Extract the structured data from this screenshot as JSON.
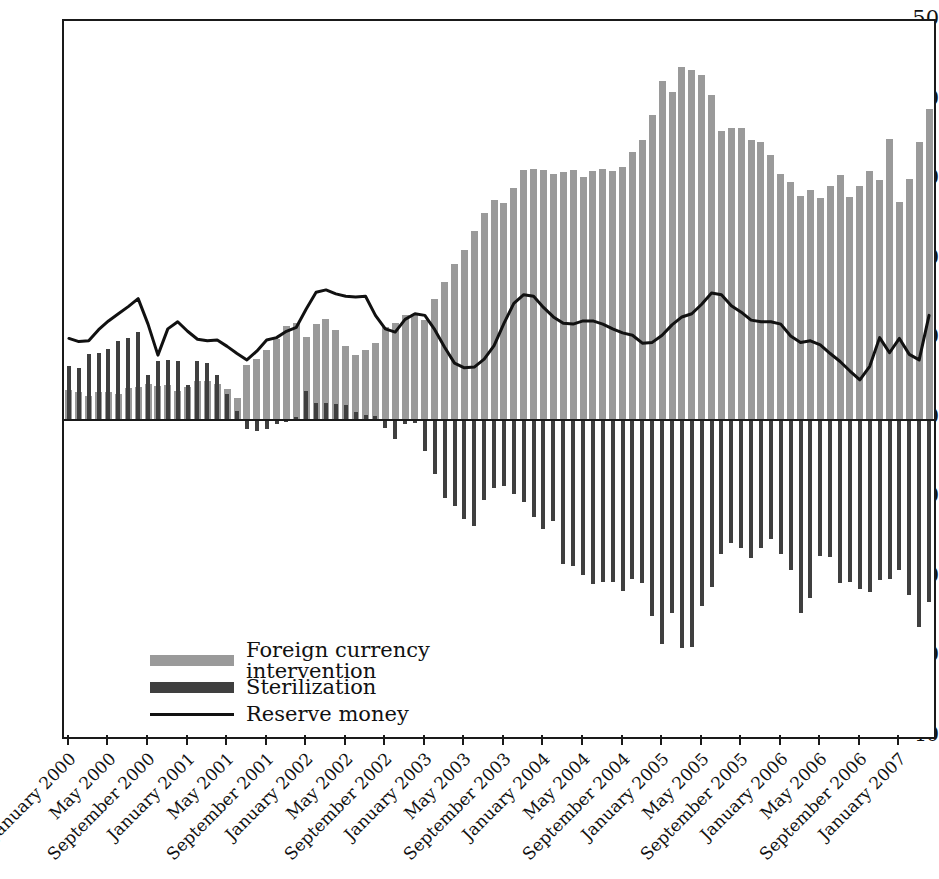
{
  "chart_data": {
    "type": "bar",
    "title": "",
    "subtitle": "",
    "xlabel": "",
    "ylabel": "",
    "ylim": [
      -40,
      50
    ],
    "yticks": [
      50,
      40,
      30,
      20,
      10,
      0,
      -10,
      -20,
      -30,
      -40
    ],
    "ytick_labels": [
      "50",
      "40",
      "30",
      "20",
      "10",
      "0",
      "−10",
      "−20",
      "−30",
      "−40"
    ],
    "grid": false,
    "legend_position": "lower-left",
    "legend": [
      {
        "label": "Foreign currency intervention",
        "marker": "bar",
        "color": "#9a9a9a"
      },
      {
        "label": "Sterilization",
        "marker": "bar",
        "color": "#3f3f3f"
      },
      {
        "label": "Reserve money",
        "marker": "line",
        "color": "#111111"
      }
    ],
    "x": [
      "January 2000",
      "February 2000",
      "March 2000",
      "April 2000",
      "May 2000",
      "June 2000",
      "July 2000",
      "August 2000",
      "September 2000",
      "October 2000",
      "November 2000",
      "December 2000",
      "January 2001",
      "February 2001",
      "March 2001",
      "April 2001",
      "May 2001",
      "June 2001",
      "July 2001",
      "August 2001",
      "September 2001",
      "October 2001",
      "November 2001",
      "December 2001",
      "January 2002",
      "February 2002",
      "March 2002",
      "April 2002",
      "May 2002",
      "June 2002",
      "July 2002",
      "August 2002",
      "September 2002",
      "October 2002",
      "November 2002",
      "December 2002",
      "January 2003",
      "February 2003",
      "March 2003",
      "April 2003",
      "May 2003",
      "June 2003",
      "July 2003",
      "August 2003",
      "September 2003",
      "October 2003",
      "November 2003",
      "December 2003",
      "January 2004",
      "February 2004",
      "March 2004",
      "April 2004",
      "May 2004",
      "June 2004",
      "July 2004",
      "August 2004",
      "September 2004",
      "October 2004",
      "November 2004",
      "December 2004",
      "January 2005",
      "February 2005",
      "March 2005",
      "April 2005",
      "May 2005",
      "June 2005",
      "July 2005",
      "August 2005",
      "September 2005",
      "October 2005",
      "November 2005",
      "December 2005",
      "January 2006",
      "February 2006",
      "March 2006",
      "April 2006",
      "May 2006",
      "June 2006",
      "July 2006",
      "August 2006",
      "September 2006",
      "October 2006",
      "November 2006",
      "December 2006",
      "January 2007",
      "February 2007",
      "March 2007",
      "April 2007"
    ],
    "xtick_labels": [
      "January 2000",
      "May 2000",
      "September 2000",
      "January 2001",
      "May 2001",
      "September 2001",
      "January 2002",
      "May 2002",
      "September 2002",
      "January 2003",
      "May 2003",
      "September 2003",
      "January 2004",
      "May 2004",
      "September 2004",
      "January 2005",
      "May 2005",
      "September 2005",
      "January 2006",
      "May 2006",
      "September 2006",
      "January 2007"
    ],
    "xtick_indices": [
      0,
      4,
      8,
      12,
      16,
      20,
      24,
      28,
      32,
      36,
      40,
      44,
      48,
      52,
      56,
      60,
      64,
      68,
      72,
      76,
      80,
      84
    ],
    "series": [
      {
        "name": "Foreign currency intervention",
        "type": "bar",
        "color": "#9a9a9a",
        "values": [
          3.6,
          3.4,
          2.9,
          3.4,
          3.4,
          3.1,
          3.9,
          4.0,
          4.4,
          4.1,
          4.2,
          3.5,
          4.0,
          4.7,
          4.8,
          4.4,
          3.8,
          2.6,
          6.8,
          7.5,
          8.6,
          10.0,
          11.6,
          12.1,
          10.3,
          11.9,
          12.6,
          11.2,
          9.2,
          8.0,
          8.7,
          9.5,
          11.5,
          12.0,
          13.0,
          13.2,
          12.4,
          15.1,
          17.2,
          19.4,
          21.2,
          23.6,
          25.9,
          27.5,
          27.1,
          29.0,
          31.3,
          31.4,
          31.3,
          30.8,
          31.0,
          31.3,
          30.4,
          31.2,
          31.4,
          31.2,
          31.7,
          33.5,
          35.0,
          38.2,
          42.4,
          41.1,
          44.2,
          43.9,
          43.2,
          40.7,
          36.2,
          36.6,
          36.6,
          35.0,
          34.8,
          33.1,
          30.8,
          29.8,
          28.0,
          28.7,
          27.7,
          29.2,
          30.7,
          27.9,
          29.2,
          31.2,
          30.0,
          35.2,
          27.2,
          30.2,
          34.8,
          39.0
        ]
      },
      {
        "name": "Sterilization",
        "type": "bar",
        "color": "#3f3f3f",
        "values": [
          6.6,
          6.4,
          8.1,
          8.3,
          8.8,
          9.8,
          10.1,
          10.9,
          5.5,
          7.2,
          7.4,
          7.3,
          4.2,
          7.3,
          7.0,
          5.5,
          3.1,
          1.0,
          -1.3,
          -1.5,
          -1.3,
          -0.6,
          -0.4,
          0.2,
          3.5,
          2.0,
          2.0,
          1.9,
          1.7,
          0.9,
          0.5,
          0.3,
          -1.1,
          -2.6,
          -0.6,
          -0.5,
          -4.0,
          -6.9,
          -9.9,
          -11.0,
          -12.6,
          -13.5,
          -10.2,
          -8.7,
          -8.4,
          -9.4,
          -10.5,
          -12.4,
          -13.9,
          -12.9,
          -18.2,
          -18.5,
          -19.7,
          -20.8,
          -20.5,
          -20.5,
          -21.6,
          -20.2,
          -20.7,
          -24.8,
          -28.3,
          -24.4,
          -28.8,
          -28.7,
          -23.5,
          -21.2,
          -17.0,
          -15.6,
          -16.2,
          -17.5,
          -16.3,
          -15.1,
          -17.0,
          -19.0,
          -24.4,
          -22.5,
          -17.2,
          -17.4,
          -20.6,
          -20.5,
          -21.4,
          -21.8,
          -20.3,
          -20.2,
          -19.0,
          -22.2,
          -26.2,
          -23.0
        ]
      },
      {
        "name": "Reserve money",
        "type": "line",
        "color": "#111111",
        "values": [
          10.1,
          9.7,
          9.8,
          11.2,
          12.3,
          13.2,
          14.1,
          15.1,
          11.9,
          8.0,
          11.3,
          12.2,
          11.0,
          10.0,
          9.8,
          9.9,
          9.1,
          8.2,
          7.4,
          8.5,
          9.9,
          10.2,
          11.0,
          11.5,
          13.8,
          15.9,
          16.2,
          15.7,
          15.4,
          15.3,
          15.4,
          13.0,
          11.3,
          10.9,
          12.5,
          13.2,
          13.0,
          11.2,
          9.0,
          7.0,
          6.4,
          6.5,
          7.5,
          9.2,
          12.0,
          14.5,
          15.6,
          15.4,
          14.0,
          12.8,
          12.0,
          11.9,
          12.3,
          12.3,
          11.9,
          11.3,
          10.8,
          10.5,
          9.5,
          9.6,
          10.5,
          11.8,
          12.8,
          13.2,
          14.4,
          15.8,
          15.6,
          14.2,
          13.4,
          12.4,
          12.2,
          12.2,
          11.9,
          10.4,
          9.6,
          9.8,
          9.3,
          8.2,
          7.2,
          6.0,
          4.9,
          6.6,
          10.2,
          8.3,
          10.1,
          8.1,
          7.4,
          13.0
        ]
      }
    ]
  }
}
